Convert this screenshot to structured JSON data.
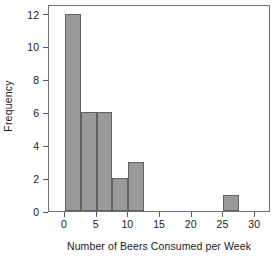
{
  "chart_data": {
    "type": "bar",
    "title": "",
    "xlabel": "Number of Beers Consumed per Week",
    "ylabel": "Frequency",
    "xlim": [
      -2.5,
      32.5
    ],
    "ylim": [
      0,
      12.6
    ],
    "xticks": [
      0,
      5,
      10,
      15,
      20,
      25,
      30
    ],
    "xtick_labels": [
      "0",
      "5",
      "10",
      "15",
      "20",
      "25",
      "30"
    ],
    "yticks": [
      0,
      2,
      4,
      6,
      8,
      10,
      12
    ],
    "ytick_labels": [
      "0",
      "2",
      "4",
      "6",
      "8",
      "10",
      "12"
    ],
    "grid": false,
    "legend": false,
    "bin_width": 2.5,
    "bins": [
      {
        "left": 0.0,
        "right": 2.5,
        "frequency": 12
      },
      {
        "left": 2.5,
        "right": 5.0,
        "frequency": 6
      },
      {
        "left": 5.0,
        "right": 7.5,
        "frequency": 6
      },
      {
        "left": 7.5,
        "right": 10.0,
        "frequency": 2
      },
      {
        "left": 10.0,
        "right": 12.5,
        "frequency": 3
      },
      {
        "left": 25.0,
        "right": 27.5,
        "frequency": 1
      }
    ],
    "categories": [
      "0-2.5",
      "2.5-5",
      "5-7.5",
      "7.5-10",
      "10-12.5",
      "25-27.5"
    ],
    "values": [
      12,
      6,
      6,
      2,
      3,
      1
    ],
    "total_count": 30
  },
  "style": {
    "bar_fill": "#9a9a9a",
    "bar_edge": "#5f6367",
    "frame": "#6b7074",
    "background": "#ffffff",
    "text": "#1a1a1a"
  }
}
